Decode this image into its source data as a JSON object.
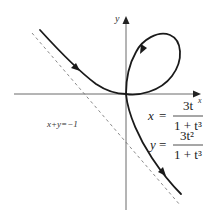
{
  "figure": {
    "axes": {
      "x_label": "x",
      "y_label": "y"
    },
    "asymptote": {
      "label": "x+y=−1"
    },
    "equations": {
      "x": {
        "lhs": "x",
        "eq": "=",
        "num": "3t",
        "den": "1 + t³"
      },
      "y": {
        "lhs": "y",
        "eq": "=",
        "num": "3t²",
        "den": "1 + t³"
      }
    },
    "colors": {
      "curve": "#1a1a1a",
      "axis": "#6b6b6b",
      "asymptote": "#8a8a8a",
      "background": "#ffffff"
    }
  }
}
